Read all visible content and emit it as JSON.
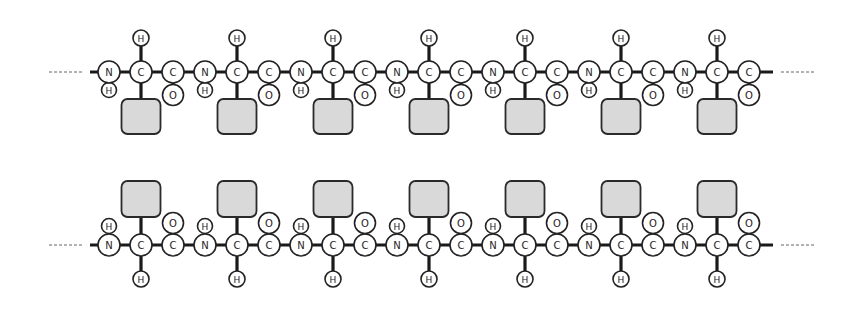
{
  "diagram": {
    "colors": {
      "background": "#ffffff",
      "atom_fill": "#ffffff",
      "atom_stroke": "#222222",
      "bond": "#1a1a1a",
      "side_chain_fill": "#d9d9d9",
      "side_chain_stroke": "#2a2a2a",
      "dashed_continuation": "#666666"
    },
    "residue_spacing": 96,
    "atom_labels": {
      "nitrogen": "N",
      "alpha_carbon": "C",
      "carbonyl_carbon": "C",
      "oxygen": "O",
      "hydrogen": "H"
    },
    "chains": [
      {
        "name": "top-chain",
        "orientation": "side-chains-down",
        "backbone_y": 72,
        "residue_count": 7,
        "first_n_x": 109,
        "left_dash": [
          49,
          84
        ],
        "right_dash": [
          781,
          816
        ],
        "bond_start_x": 90,
        "bond_end_x": 773
      },
      {
        "name": "bottom-chain",
        "orientation": "side-chains-up",
        "backbone_y": 245,
        "residue_count": 7,
        "first_n_x": 109,
        "left_dash": [
          49,
          84
        ],
        "right_dash": [
          781,
          816
        ],
        "bond_start_x": 90,
        "bond_end_x": 773
      }
    ]
  }
}
